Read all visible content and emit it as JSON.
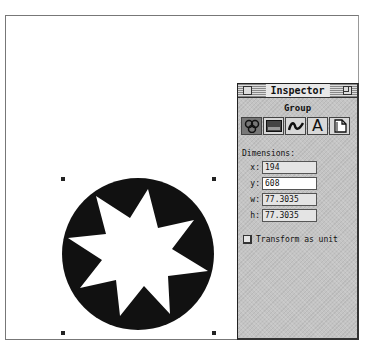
{
  "canvas": {
    "selection_handles": [
      {
        "x": 62,
        "y": 178
      },
      {
        "x": 213,
        "y": 178
      },
      {
        "x": 62,
        "y": 332
      },
      {
        "x": 213,
        "y": 332
      }
    ],
    "artwork": {
      "shape": "eight-point-star-in-circle",
      "circle_fill": "#111111",
      "star_fill": "#ffffff"
    }
  },
  "inspector": {
    "title": "Inspector",
    "section_title": "Group",
    "tabs": [
      {
        "name": "group-tab",
        "icon": "group-icon",
        "selected": true
      },
      {
        "name": "fill-tab",
        "icon": "fill-icon",
        "selected": false
      },
      {
        "name": "stroke-tab",
        "icon": "stroke-icon",
        "selected": false
      },
      {
        "name": "text-tab",
        "icon": "text-icon",
        "glyph": "A",
        "selected": false
      },
      {
        "name": "document-tab",
        "icon": "document-icon",
        "selected": false
      }
    ],
    "dimensions_label": "Dimensions:",
    "fields": {
      "x": {
        "label": "x:",
        "value": "194"
      },
      "y": {
        "label": "y:",
        "value": "608",
        "active": true
      },
      "w": {
        "label": "w:",
        "value": "77.3035"
      },
      "h": {
        "label": "h:",
        "value": "77.3035"
      }
    },
    "transform_checkbox": {
      "label": "Transform as unit",
      "checked": false
    }
  }
}
